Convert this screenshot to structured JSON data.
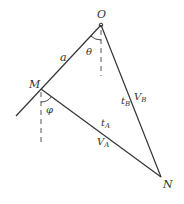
{
  "diagram": {
    "colors": {
      "line": "#333333",
      "dash": "#555555",
      "background": "#ffffff"
    },
    "points": {
      "O": {
        "label": "O",
        "x": 101,
        "y": 25
      },
      "M": {
        "label": "M",
        "x": 41,
        "y": 89
      },
      "N": {
        "label": "N",
        "x": 161,
        "y": 177
      }
    },
    "labels": {
      "a": "a",
      "theta": "θ",
      "phi": "φ",
      "tA_main": "t",
      "tA_sub": "A",
      "VA_main": "V",
      "VA_sub": "A",
      "tB_main": "t",
      "tB_sub": "B",
      "VB_main": "V",
      "VB_sub": "B"
    }
  }
}
